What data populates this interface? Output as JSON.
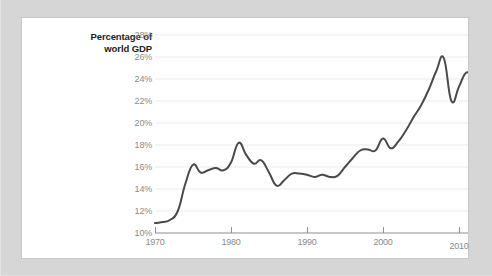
{
  "card": {
    "background_color": "#ffffff",
    "outer_background_color": "#d6d6d6"
  },
  "chart_data": {
    "type": "line",
    "title": "",
    "subtitle": "",
    "xlabel": "",
    "ylabel": "Percentage of\nworld GDP",
    "ylabel_line1": "Percentage of",
    "ylabel_line2": "world GDP",
    "xlim": [
      1970,
      2012
    ],
    "ylim": [
      10,
      28
    ],
    "y_tick_suffix": "%",
    "y_ticks": [
      10,
      12,
      14,
      16,
      18,
      20,
      22,
      24,
      26,
      28
    ],
    "y_tick_labels": [
      "10%",
      "12%",
      "14%",
      "16%",
      "18%",
      "20%",
      "22%",
      "24%",
      "26%",
      "28%"
    ],
    "x_ticks": [
      1970,
      1980,
      1990,
      2000,
      2010
    ],
    "x_tick_labels": [
      "1970",
      "1980",
      "1990",
      "2000",
      "2010"
    ],
    "grid": "horizontal",
    "grid_color": "#ebebeb",
    "axis_color": "#9a9a9a",
    "legend": "none",
    "series": [
      {
        "name": "Percentage of world GDP",
        "color": "#4a4a4a",
        "line_width": 2,
        "x": [
          1970,
          1971,
          1972,
          1973,
          1974,
          1975,
          1976,
          1977,
          1978,
          1979,
          1980,
          1981,
          1982,
          1983,
          1984,
          1985,
          1986,
          1987,
          1988,
          1989,
          1990,
          1991,
          1992,
          1993,
          1994,
          1995,
          1996,
          1997,
          1998,
          1999,
          2000,
          2001,
          2002,
          2003,
          2004,
          2005,
          2006,
          2007,
          2008,
          2009,
          2010,
          2011,
          2012
        ],
        "values": [
          10.9,
          11.0,
          11.2,
          12.0,
          14.5,
          16.2,
          15.5,
          15.7,
          15.9,
          15.7,
          16.4,
          18.2,
          17.1,
          16.3,
          16.6,
          15.5,
          14.3,
          14.8,
          15.4,
          15.4,
          15.3,
          15.1,
          15.3,
          15.1,
          15.2,
          16.0,
          16.8,
          17.5,
          17.6,
          17.5,
          18.6,
          17.7,
          18.3,
          19.3,
          20.5,
          21.6,
          23.0,
          24.7,
          25.9,
          22.0,
          23.3,
          24.6,
          23.9
        ]
      }
    ]
  }
}
